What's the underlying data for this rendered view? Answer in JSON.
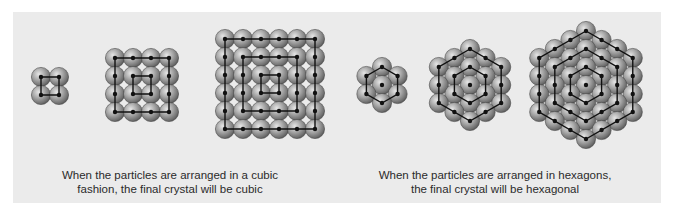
{
  "figure": {
    "background_color": "#ebebeb",
    "sphere_color": "#9a9a9a",
    "line_color": "#111111"
  },
  "cubic": {
    "caption_line1": "When the particles are arranged in a cubic",
    "caption_line2": "fashion, the final crystal will be cubic",
    "stages": [
      {
        "label": "2x2",
        "size": 2,
        "x0": 41,
        "y0": 77
      },
      {
        "label": "4x4",
        "size": 4,
        "x0": 115,
        "y0": 58
      },
      {
        "label": "6x6",
        "size": 6,
        "x0": 225,
        "y0": 39
      }
    ]
  },
  "hexagonal": {
    "caption_line1": "When the particles are arranged in hexagons,",
    "caption_line2": "the final crystal will be hexagonal",
    "stages": [
      {
        "label": "ring-1",
        "rings": 1,
        "cx": 382,
        "cy": 85
      },
      {
        "label": "ring-2",
        "rings": 2,
        "cx": 470,
        "cy": 85
      },
      {
        "label": "ring-3",
        "rings": 3,
        "cx": 586,
        "cy": 85
      }
    ]
  }
}
